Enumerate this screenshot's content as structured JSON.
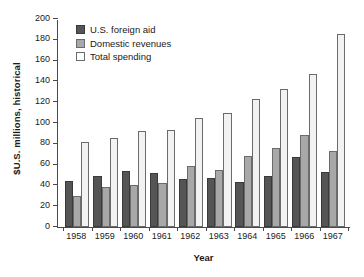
{
  "chart_data": {
    "type": "bar",
    "title": "",
    "xlabel": "Year",
    "ylabel": "$U.S. millions, historical",
    "categories": [
      "1958",
      "1959",
      "1960",
      "1961",
      "1962",
      "1963",
      "1964",
      "1965",
      "1966",
      "1967"
    ],
    "ylim": [
      0,
      200
    ],
    "yticks": [
      0,
      20,
      40,
      60,
      80,
      100,
      120,
      140,
      160,
      180,
      200
    ],
    "grid": false,
    "legend_position": "top-left",
    "series": [
      {
        "name": "U.S. foreign aid",
        "color": "#555555",
        "values": [
          44,
          49,
          54,
          52,
          46,
          47,
          43,
          49,
          67,
          53
        ]
      },
      {
        "name": "Domestic revenues",
        "color": "#a8a8a8",
        "values": [
          30,
          38,
          40,
          42,
          59,
          55,
          68,
          76,
          88,
          73
        ]
      },
      {
        "name": "Total spending",
        "color": "#f2f2f2",
        "values": [
          82,
          86,
          92,
          93,
          105,
          110,
          123,
          133,
          147,
          186
        ]
      }
    ]
  }
}
